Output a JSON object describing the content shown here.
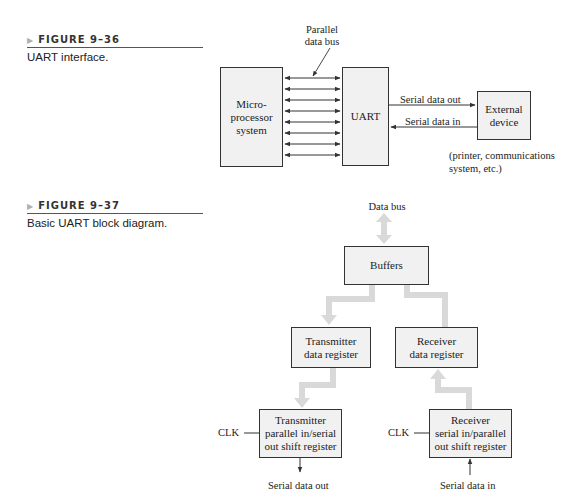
{
  "figure_36": {
    "number": "FIGURE 9–36",
    "caption": "UART interface.",
    "blocks": {
      "microprocessor": [
        "Micro-",
        "processor",
        "system"
      ],
      "uart": "UART",
      "external_device": [
        "External",
        "device"
      ]
    },
    "labels": {
      "parallel_bus": [
        "Parallel",
        "data bus"
      ],
      "serial_out": "Serial data out",
      "serial_in": "Serial data in",
      "device_examples": [
        "(printer, communications",
        "system, etc.)"
      ]
    },
    "bus_line_count": 8
  },
  "figure_37": {
    "number": "FIGURE 9–37",
    "caption": "Basic UART block diagram.",
    "labels": {
      "data_bus": "Data bus",
      "clk_tx": "CLK",
      "clk_rx": "CLK",
      "serial_out": "Serial data out",
      "serial_in": "Serial data in"
    },
    "blocks": {
      "buffers": "Buffers",
      "tx_data_register": [
        "Transmitter",
        "data register"
      ],
      "rx_data_register": [
        "Receiver",
        "data register"
      ],
      "tx_shift_register": [
        "Transmitter",
        "parallel in/serial",
        "out shift register"
      ],
      "rx_shift_register": [
        "Receiver",
        "serial in/parallel",
        "out shift register"
      ]
    }
  },
  "colors": {
    "box_fill": "#f1f1f1",
    "box_border": "#333333",
    "wide_arrow": "#d9d9d9",
    "rule": "#555555"
  }
}
